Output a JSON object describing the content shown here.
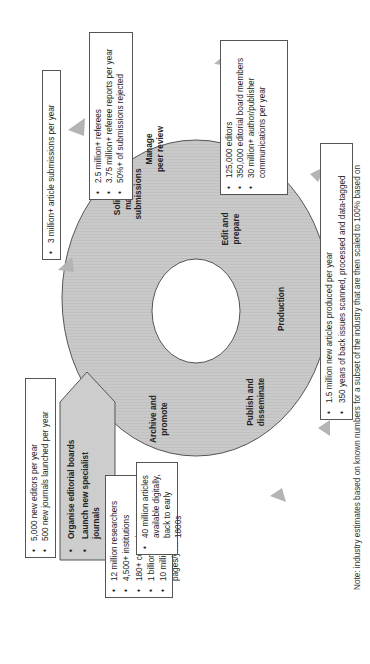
{
  "diagram": {
    "orientation": "rotated 90 degrees counter-clockwise",
    "stages": [
      {
        "id": "solicit",
        "label": "Solicit and manage submissions",
        "lines": [
          "Solicit and",
          "manage",
          "submissions"
        ]
      },
      {
        "id": "peer_review",
        "label": "Manage peer review",
        "lines": [
          "Manage",
          "peer review"
        ]
      },
      {
        "id": "edit",
        "label": "Edit and prepare",
        "lines": [
          "Edit and",
          "prepare"
        ]
      },
      {
        "id": "production",
        "label": "Production",
        "lines": [
          "Production"
        ]
      },
      {
        "id": "publish",
        "label": "Publish and disseminate",
        "lines": [
          "Publish and",
          "disseminate"
        ]
      },
      {
        "id": "archive",
        "label": "Archive and promote",
        "lines": [
          "Archive and",
          "promote"
        ]
      }
    ],
    "callouts": {
      "submissions": [
        "3 million+ article submissions per year"
      ],
      "peer_review": [
        "2.5 million+ referees",
        "3.75 million+ referee reports per year",
        "50%+ of submissions rejected"
      ],
      "edit": [
        "125,000 editors",
        "350,000 editorial board members",
        "30 million+ author/publisher communications per year"
      ],
      "production": [
        "1.5 million new articles produced per year",
        "350 years of back issues scanned, processed and data-tagged"
      ],
      "publish": [
        "12 million researchers",
        "4,500+ institutions",
        "180+ countries",
        "1 billion+ downloads/year",
        "10 million+ printed pages/year"
      ],
      "archive": [
        "40 million articles available digitally, back to early 1800s"
      ],
      "launch": [
        "Organise editorial boards",
        "Launch new specialist journals"
      ],
      "editors_new": [
        "5,000 new editors per year",
        "500 new journals launched per year"
      ]
    },
    "note": "Note: industry estimates based on known numbers for a subset of the industry that are then scaled to 100% based on",
    "colors": {
      "ring_fill": "#c8c8c8",
      "ring_stroke": "#555555",
      "arrow_fill": "#b4b4b4",
      "pentagon_fill": "#cccccc",
      "box_border": "#555555"
    }
  }
}
